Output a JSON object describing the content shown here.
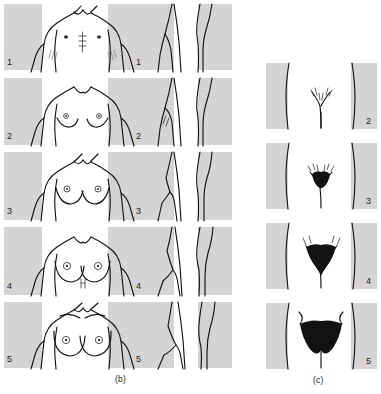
{
  "figure": {
    "panels": [
      {
        "id": "b",
        "caption": "(b)",
        "subject": "breast development",
        "views": [
          "frontal",
          "lateral-left",
          "lateral-right"
        ],
        "stages": [
          {
            "number": "1",
            "label_front": "1",
            "label_side": "1",
            "description": "Prepubertal; elevation of papilla only"
          },
          {
            "number": "2",
            "label_front": "2",
            "label_side": "2",
            "description": "Breast bud stage; elevation of breast and papilla, enlargement of areola"
          },
          {
            "number": "3",
            "label_front": "3",
            "label_side": "3",
            "description": "Further enlargement of breast and areola, no separation of contours"
          },
          {
            "number": "4",
            "label_front": "4",
            "label_side": "4",
            "description": "Areola and papilla form a secondary mound above the level of the breast"
          },
          {
            "number": "5",
            "label_front": "5",
            "label_side": "5",
            "description": "Mature stage; projection of papilla only, areola recessed to breast contour"
          }
        ]
      },
      {
        "id": "c",
        "caption": "(c)",
        "subject": "pubic hair development",
        "stages": [
          {
            "number": "2",
            "description": "Sparse growth of long, slightly pigmented downy hair along the labia"
          },
          {
            "number": "3",
            "description": "Darker, coarser, curlier hair spreading sparsely over the junction of the pubes"
          },
          {
            "number": "4",
            "description": "Adult-type hair covering a smaller area than in the adult; no spread to thighs"
          },
          {
            "number": "5",
            "description": "Adult in quantity and type, spread as an inverse triangle to the medial thighs"
          }
        ]
      }
    ],
    "colors": {
      "background_block": "#d4d4d4",
      "outline": "#141414",
      "hair": "#121212",
      "page": "#ffffff"
    }
  }
}
